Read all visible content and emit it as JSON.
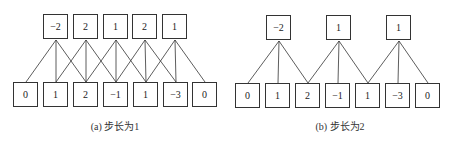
{
  "panels": [
    {
      "caption": "(a) 步长为1",
      "stride": 1,
      "outputs": [
        "−2",
        "2",
        "1",
        "2",
        "1"
      ],
      "inputs": [
        "0",
        "1",
        "2",
        "−1",
        "1",
        "−3",
        "0"
      ]
    },
    {
      "caption": "(b) 步长为2",
      "stride": 2,
      "outputs": [
        "−2",
        "1",
        "1"
      ],
      "inputs": [
        "0",
        "1",
        "2",
        "−1",
        "1",
        "−3",
        "0"
      ]
    }
  ],
  "colors": {
    "line": "#333333",
    "border": "#333333",
    "text": "#222222"
  }
}
